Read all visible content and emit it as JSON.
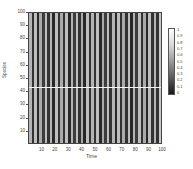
{
  "chart_data": {
    "type": "heatmap",
    "title": "",
    "xlabel": "Time",
    "ylabel": "Species",
    "xlim": [
      0,
      100
    ],
    "ylim": [
      0,
      100
    ],
    "xticks": [
      10,
      20,
      30,
      40,
      50,
      60,
      70,
      80,
      90,
      100
    ],
    "yticks": [
      10,
      20,
      30,
      40,
      50,
      60,
      70,
      80,
      90,
      100
    ],
    "colorbar": {
      "min": 0,
      "max": 1,
      "ticks": [
        0,
        0.1,
        0.2,
        0.3,
        0.4,
        0.5,
        0.6,
        0.7,
        0.8,
        0.9,
        1
      ],
      "colormap": "grayscale (0=black, 1=white)"
    },
    "pattern": "vertical stripes: values constant across Species, alternating across Time",
    "column_values": [
      0.75,
      0.1,
      0.8,
      0.05,
      0.7,
      0.15,
      0.8,
      0.1,
      0.75,
      0.05,
      0.8,
      0.1,
      0.7,
      0.1,
      0.8,
      0.05,
      0.75,
      0.15,
      0.8,
      0.1,
      0.7,
      0.05,
      0.8,
      0.1,
      0.75,
      0.1,
      0.8,
      0.05,
      0.7,
      0.15,
      0.8,
      0.1,
      0.75,
      0.05,
      0.8,
      0.1,
      0.7,
      0.1,
      0.8,
      0.05,
      0.75,
      0.15,
      0.8,
      0.1,
      0.7,
      0.05,
      0.8,
      0.1,
      0.75,
      0.1,
      0.85
    ],
    "horizontal_line": {
      "y": 44,
      "color": "white"
    },
    "grid": false,
    "legend_position": "right"
  },
  "axes": {
    "x_tick_labels": [
      "10",
      "20",
      "30",
      "40",
      "50",
      "60",
      "70",
      "80",
      "90",
      "100"
    ],
    "y_tick_labels": [
      "10",
      "20",
      "30",
      "40",
      "50",
      "60",
      "70",
      "80",
      "90",
      "100"
    ],
    "colorbar_labels": [
      "1",
      "0.9",
      "0.8",
      "0.7",
      "0.6",
      "0.5",
      "0.4",
      "0.3",
      "0.2",
      "0.1",
      "0"
    ]
  }
}
